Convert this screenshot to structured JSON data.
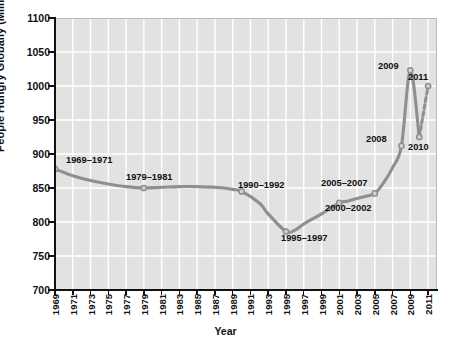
{
  "chart_data": {
    "type": "line",
    "title": "",
    "xlabel": "Year",
    "ylabel": "People Hungry Globally (Millions)",
    "xlim": [
      1969,
      2012
    ],
    "ylim": [
      700,
      1100
    ],
    "grid": true,
    "legend": false,
    "y_ticks": [
      700,
      750,
      800,
      850,
      900,
      950,
      1000,
      1050,
      1100
    ],
    "x_ticks": [
      1969,
      1971,
      1973,
      1975,
      1977,
      1979,
      1981,
      1983,
      1985,
      1987,
      1989,
      1991,
      1993,
      1995,
      1997,
      1999,
      2001,
      2003,
      2005,
      2007,
      2009,
      2011
    ],
    "line_color": "#8f8f8f",
    "series": [
      {
        "name": "People Hungry Globally",
        "style": "solid",
        "x": [
          1969,
          1971,
          1973,
          1975,
          1977,
          1979,
          1981,
          1983,
          1985,
          1987,
          1989,
          1990,
          1992,
          1993,
          1995,
          1996,
          1997,
          1999,
          2001,
          2002,
          2004,
          2005,
          2006,
          2007,
          2008,
          2009,
          2010
        ],
        "values": [
          878,
          868,
          861,
          856,
          852,
          850,
          851,
          852,
          852,
          851,
          848,
          845,
          828,
          812,
          786,
          788,
          797,
          812,
          828,
          831,
          838,
          842,
          858,
          880,
          912,
          1023,
          925
        ]
      },
      {
        "name": "Projection 2010-2011",
        "style": "dashed",
        "x": [
          2010,
          2011
        ],
        "values": [
          925,
          1000
        ]
      }
    ],
    "markers": [
      {
        "label": "1969–1971",
        "x": 1969,
        "y": 878
      },
      {
        "label": "1979–1981",
        "x": 1979,
        "y": 850
      },
      {
        "label": "1990–1992",
        "x": 1990,
        "y": 845
      },
      {
        "label": "1995–1997",
        "x": 1995,
        "y": 786
      },
      {
        "label": "2000–2002",
        "x": 2001,
        "y": 828
      },
      {
        "label": "2005–2007",
        "x": 2005,
        "y": 842
      },
      {
        "label": "2008",
        "x": 2008,
        "y": 912
      },
      {
        "label": "2009",
        "x": 2009,
        "y": 1023
      },
      {
        "label": "2010",
        "x": 2010,
        "y": 925
      },
      {
        "label": "2011",
        "x": 2011,
        "y": 1000
      }
    ],
    "annotations": [
      {
        "name": "annotation-1969-1971",
        "text": "1969–1971"
      },
      {
        "name": "annotation-1979-1981",
        "text": "1979–1981"
      },
      {
        "name": "annotation-1990-1992",
        "text": "1990–1992"
      },
      {
        "name": "annotation-1995-1997",
        "text": "1995–1997"
      },
      {
        "name": "annotation-2000-2002",
        "text": "2000–2002"
      },
      {
        "name": "annotation-2005-2007",
        "text": "2005–2007"
      },
      {
        "name": "annotation-2008",
        "text": "2008"
      },
      {
        "name": "annotation-2009",
        "text": "2009"
      },
      {
        "name": "annotation-2010",
        "text": "2010"
      },
      {
        "name": "annotation-2011",
        "text": "2011"
      }
    ],
    "colors": {
      "plot_background": "#e2e2e2",
      "gridline": "#ffffff",
      "axis": "#111111",
      "line": "#8f8f8f",
      "text": "#111111",
      "figure_background": "#ffffff"
    }
  }
}
